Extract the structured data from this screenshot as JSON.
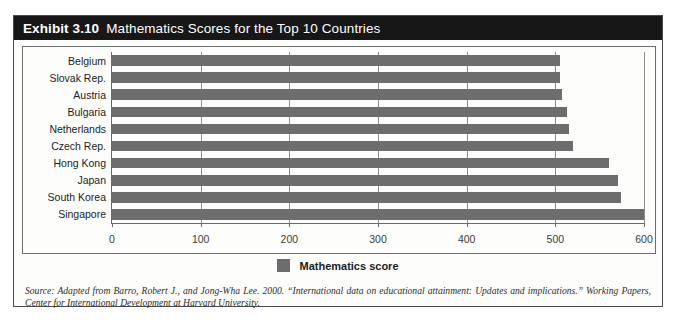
{
  "exhibit": {
    "number": "Exhibit 3.10",
    "title": "Mathematics Scores for the Top 10 Countries",
    "source": "Source: Adapted from Barro, Robert J., and Jong-Wha Lee. 2000. “International data on educational attainment: Updates and implications.” Working Papers, Center for International Development at Harvard University."
  },
  "chart_data": {
    "type": "bar",
    "orientation": "horizontal",
    "title": "Mathematics Scores for the Top 10 Countries",
    "xlabel": "",
    "ylabel": "",
    "xlim": [
      0,
      600
    ],
    "xticks": [
      0,
      100,
      200,
      300,
      400,
      500,
      600
    ],
    "xtick_labels": [
      "0",
      "100",
      "200",
      "300",
      "400",
      "500",
      "600"
    ],
    "grid": true,
    "legend": {
      "position": "bottom",
      "entries": [
        "Mathematics score"
      ]
    },
    "series": [
      {
        "name": "Mathematics score",
        "color": "#6d6d6d",
        "values": [
          505,
          505,
          508,
          513,
          515,
          520,
          560,
          571,
          574,
          600
        ]
      }
    ],
    "categories": [
      "Belgium",
      "Slovak Rep.",
      "Austria",
      "Bulgaria",
      "Netherlands",
      "Czech Rep.",
      "Hong Kong",
      "Japan",
      "South Korea",
      "Singapore"
    ]
  }
}
